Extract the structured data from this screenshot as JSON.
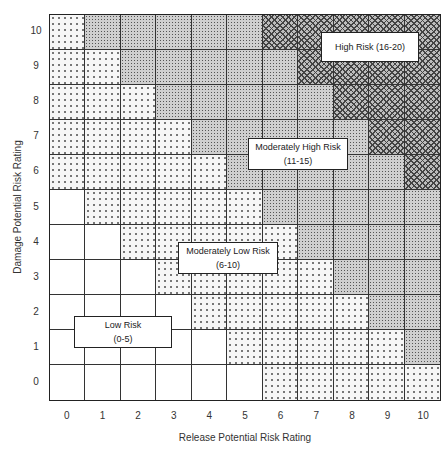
{
  "chart_data": {
    "type": "heatmap",
    "title": "",
    "xlabel": "Release Potential Risk Rating",
    "ylabel": "Damage Potential Risk Rating",
    "x_ticks": [
      "0",
      "1",
      "2",
      "3",
      "4",
      "5",
      "6",
      "7",
      "8",
      "9",
      "10"
    ],
    "y_ticks": [
      "0",
      "1",
      "2",
      "3",
      "4",
      "5",
      "6",
      "7",
      "8",
      "9",
      "10"
    ],
    "rule": "risk score = release rating + damage rating",
    "categories": [
      {
        "name": "Low Risk",
        "range": "(0-5)",
        "min": 0,
        "max": 5,
        "pattern": "white"
      },
      {
        "name": "Moderately Low Risk",
        "range": "(6-10)",
        "min": 6,
        "max": 10,
        "pattern": "sparse dots"
      },
      {
        "name": "Moderately High Risk",
        "range": "(11-15)",
        "min": 11,
        "max": 15,
        "pattern": "dense dots"
      },
      {
        "name": "High Risk",
        "range": "(16-20)",
        "min": 16,
        "max": 20,
        "pattern": "crosshatch"
      }
    ],
    "grid": true,
    "legend_position": "inline labels"
  },
  "labels": {
    "high": {
      "title": "High Risk (16-20)"
    },
    "mod_high": {
      "title": "Moderately High Risk",
      "range": "(11-15)"
    },
    "mod_low": {
      "title": "Moderately Low Risk",
      "range": "(6-10)"
    },
    "low": {
      "title": "Low Risk",
      "range": "(0-5)"
    }
  }
}
